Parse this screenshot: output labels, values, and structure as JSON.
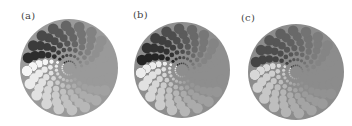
{
  "figure": {
    "panels": [
      {
        "id": "a",
        "label": "(a)",
        "label_x": 21,
        "label_y": 10,
        "cx": 69,
        "cy": 68,
        "r": 49,
        "bg": "#9a9a9a",
        "dark": "#1e1e1e",
        "light": "#f6f6f6",
        "twist": 0
      },
      {
        "id": "b",
        "label": "(b)",
        "label_x": 133,
        "label_y": 9,
        "cx": 182,
        "cy": 70,
        "r": 48,
        "bg": "#8e8e8e",
        "dark": "#161616",
        "light": "#ececec",
        "twist": 0
      },
      {
        "id": "c",
        "label": "(c)",
        "label_x": 241,
        "label_y": 12,
        "cx": 296,
        "cy": 72,
        "r": 48,
        "bg": "#8c8c8c",
        "dark": "#3a3a3a",
        "light": "#d8d8d8",
        "twist": 0
      }
    ],
    "pattern": {
      "rings": 7,
      "dots_per_ring": 20,
      "inner_radius_frac": 0.14,
      "outer_radius_frac": 0.86,
      "dot_size_frac": 0.11,
      "spiral_step_deg": 6
    }
  }
}
